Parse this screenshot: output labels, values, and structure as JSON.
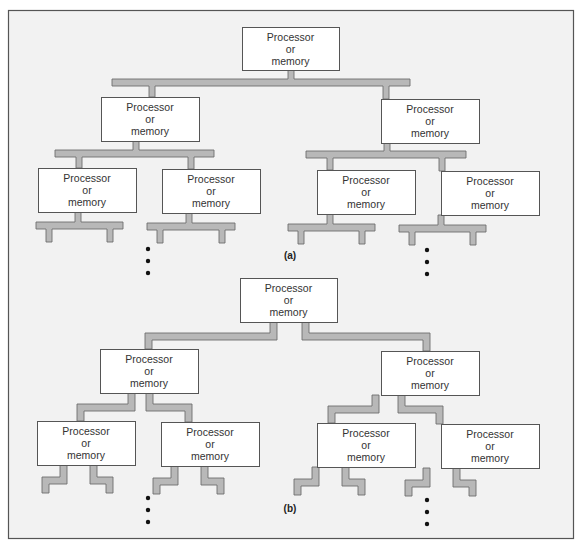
{
  "figure": {
    "colors": {
      "background": "#f2f2f2",
      "frame": "#555555",
      "bus_fill": "#b8b8b8",
      "bus_stroke": "#6e6e6e",
      "node_fill": "#ffffff",
      "node_stroke": "#555555",
      "text": "#333333"
    },
    "node_label_lines": [
      "Processor",
      "or",
      "memory"
    ],
    "panels": [
      {
        "id": "a",
        "caption": "(a)",
        "caption_pos": [
          290,
          259
        ],
        "connection_style": "shared-bus",
        "nodes": [
          {
            "id": "root",
            "level": 0,
            "x": 242,
            "y": 27,
            "w": 97,
            "h": 43
          },
          {
            "id": "l1-left",
            "level": 1,
            "x": 101,
            "y": 97,
            "w": 98,
            "h": 44
          },
          {
            "id": "l1-right",
            "level": 1,
            "x": 381,
            "y": 99,
            "w": 98,
            "h": 44
          },
          {
            "id": "l2-ll",
            "level": 2,
            "x": 38,
            "y": 168,
            "w": 98,
            "h": 44
          },
          {
            "id": "l2-lr",
            "level": 2,
            "x": 162,
            "y": 169,
            "w": 98,
            "h": 44
          },
          {
            "id": "l2-rl",
            "level": 2,
            "x": 317,
            "y": 170,
            "w": 98,
            "h": 44
          },
          {
            "id": "l2-rr",
            "level": 2,
            "x": 441,
            "y": 171,
            "w": 98,
            "h": 44
          }
        ],
        "continuation_dots": [
          {
            "x": 148,
            "ys": [
              249,
              261,
              273
            ]
          },
          {
            "x": 427,
            "ys": [
              250,
              262,
              274
            ]
          }
        ]
      },
      {
        "id": "b",
        "caption": "(b)",
        "caption_pos": [
          290,
          512
        ],
        "connection_style": "point-to-point",
        "nodes": [
          {
            "id": "root",
            "level": 0,
            "x": 240,
            "y": 278,
            "w": 97,
            "h": 44
          },
          {
            "id": "l1-left",
            "level": 1,
            "x": 100,
            "y": 349,
            "w": 98,
            "h": 44
          },
          {
            "id": "l1-right",
            "level": 1,
            "x": 381,
            "y": 351,
            "w": 98,
            "h": 44
          },
          {
            "id": "l2-ll",
            "level": 2,
            "x": 37,
            "y": 421,
            "w": 98,
            "h": 44
          },
          {
            "id": "l2-lr",
            "level": 2,
            "x": 161,
            "y": 422,
            "w": 98,
            "h": 44
          },
          {
            "id": "l2-rl",
            "level": 2,
            "x": 317,
            "y": 423,
            "w": 98,
            "h": 44
          },
          {
            "id": "l2-rr",
            "level": 2,
            "x": 441,
            "y": 424,
            "w": 98,
            "h": 44
          }
        ],
        "continuation_dots": [
          {
            "x": 148,
            "ys": [
              498,
              510,
              522
            ]
          },
          {
            "x": 427,
            "ys": [
              500,
              512,
              524
            ]
          }
        ]
      }
    ]
  }
}
